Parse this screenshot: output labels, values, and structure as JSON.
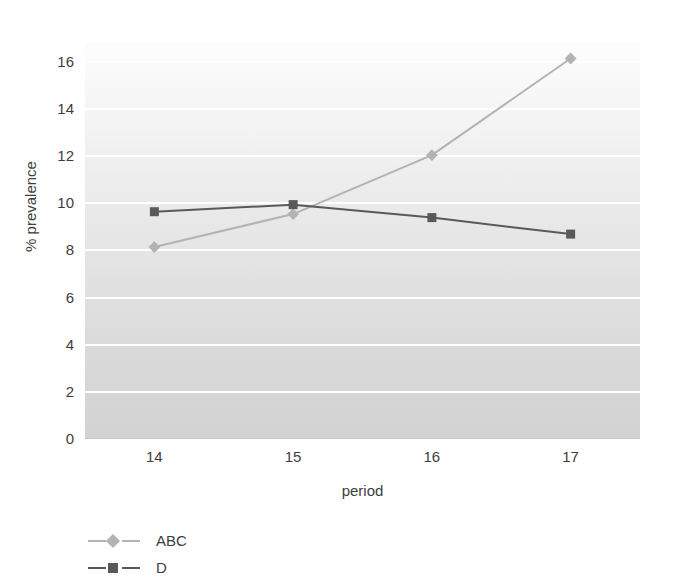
{
  "chart_data": {
    "type": "line",
    "title": "",
    "xlabel": "period",
    "ylabel": "% prevalence",
    "categories": [
      "14",
      "15",
      "16",
      "17"
    ],
    "x": [
      14,
      15,
      16,
      17
    ],
    "xlim": [
      13.5,
      17.5
    ],
    "ylim": [
      0,
      16.8
    ],
    "yticks": [
      0,
      2,
      4,
      6,
      8,
      10,
      12,
      14,
      16
    ],
    "ytick_labels": [
      "0",
      "2",
      "4",
      "6",
      "8",
      "10",
      "12",
      "14",
      "16"
    ],
    "grid": "horizontal",
    "legend_position": "below-left",
    "series": [
      {
        "name": "ABC",
        "values": [
          8.1,
          9.5,
          12.0,
          16.1
        ],
        "color": "#b3b3b3",
        "marker": "diamond"
      },
      {
        "name": "D",
        "values": [
          9.6,
          9.9,
          9.35,
          8.65
        ],
        "color": "#595959",
        "marker": "square"
      }
    ]
  },
  "axes": {
    "y_title": "% prevalence",
    "x_title": "period"
  },
  "legend": {
    "items": [
      {
        "label": "ABC",
        "color": "#b3b3b3",
        "marker": "diamond"
      },
      {
        "label": "D",
        "color": "#595959",
        "marker": "square"
      }
    ]
  },
  "colors": {
    "series_abc": "#b3b3b3",
    "series_d": "#595959",
    "gridline": "#ffffff",
    "plot_bg_top": "#fdfdfd",
    "plot_bg_bottom": "#d2d2d2",
    "text": "#3d3d3d"
  }
}
